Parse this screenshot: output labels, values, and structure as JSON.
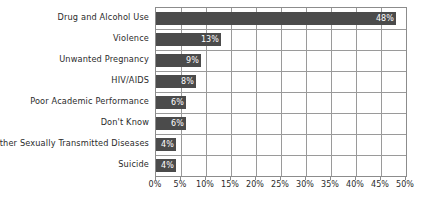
{
  "chart_data": {
    "type": "bar",
    "orientation": "horizontal",
    "title": "",
    "subtitle": "",
    "xlabel": "",
    "ylabel": "",
    "xlim": [
      0,
      50
    ],
    "xtick_step": 5,
    "grid": true,
    "legend": false,
    "value_label_suffix": "%",
    "bar_color": "#4b4b4b",
    "value_label_color": "#ffffff",
    "grid_color": "#9a9a9a",
    "axis_color": "#8c8c8c",
    "background_color": "#ffffff",
    "categories": [
      "Drug and Alcohol Use",
      "Violence",
      "Unwanted Pregnancy",
      "HIV/AIDS",
      "Poor Academic Performance",
      "Don't Know",
      "Other Sexually Transmitted Diseases",
      "Suicide"
    ],
    "values": [
      48,
      13,
      9,
      8,
      6,
      6,
      4,
      4
    ],
    "value_labels": [
      "48%",
      "13%",
      "9%",
      "8%",
      "6%",
      "6%",
      "4%",
      "4%"
    ],
    "xticks": [
      0,
      5,
      10,
      15,
      20,
      25,
      30,
      35,
      40,
      45,
      50
    ],
    "xtick_labels": [
      "0%",
      "5%",
      "10%",
      "15%",
      "20%",
      "25%",
      "30%",
      "35%",
      "40%",
      "45%",
      "50%"
    ]
  }
}
